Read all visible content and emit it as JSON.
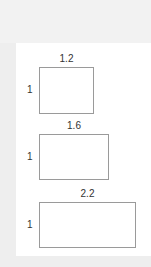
{
  "rectangles": [
    {
      "width_label": "1.2",
      "height_label": "1"
    },
    {
      "width_label": "1.6",
      "height_label": "1"
    },
    {
      "width_label": "2.2",
      "height_label": "1"
    }
  ]
}
